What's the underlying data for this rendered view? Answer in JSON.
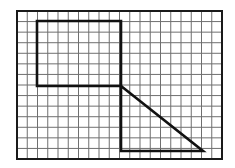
{
  "diagram": {
    "type": "grid-figure",
    "grid": {
      "origin_x": 17,
      "origin_y": 11,
      "width": 205,
      "height": 148,
      "cols": 20,
      "rows": 14,
      "line_color": "#6f6f6f",
      "frame_color": "#1a1a1a"
    },
    "shapes": [
      {
        "name": "rectangle",
        "points": [
          [
            37,
            21
          ],
          [
            121,
            21
          ],
          [
            121,
            86
          ],
          [
            37,
            86
          ]
        ],
        "closed": true
      },
      {
        "name": "right-triangle",
        "points": [
          [
            121,
            86
          ],
          [
            203,
            151
          ],
          [
            121,
            151
          ]
        ],
        "closed": true
      }
    ],
    "stroke_color": "#111111",
    "stroke_width": 2.6
  }
}
